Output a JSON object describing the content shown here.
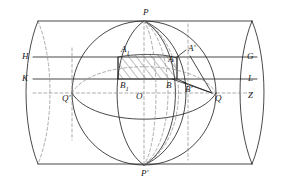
{
  "figure": {
    "stroke_color": "#1b1b1b",
    "dashed_color": "#7a7a7a",
    "hatch_color": "#4a4a4a",
    "background": "#ffffff"
  },
  "labels": [
    {
      "id": "P",
      "text": "P",
      "sub": "",
      "prime": "",
      "x": 143,
      "y": 8
    },
    {
      "id": "P-prime",
      "text": "P",
      "sub": "",
      "prime": "′",
      "x": 141,
      "y": 169
    },
    {
      "id": "H",
      "text": "H",
      "sub": "",
      "prime": "",
      "x": 22,
      "y": 52
    },
    {
      "id": "K",
      "text": "K",
      "sub": "",
      "prime": "",
      "x": 22,
      "y": 74
    },
    {
      "id": "G",
      "text": "G",
      "sub": "",
      "prime": "",
      "x": 247,
      "y": 52
    },
    {
      "id": "L",
      "text": "L",
      "sub": "",
      "prime": "",
      "x": 248,
      "y": 74
    },
    {
      "id": "Z",
      "text": "Z",
      "sub": "",
      "prime": "",
      "x": 248,
      "y": 91
    },
    {
      "id": "Q",
      "text": "Q",
      "sub": "",
      "prime": "",
      "x": 215,
      "y": 94
    },
    {
      "id": "Q-prime",
      "text": "Q",
      "sub": "",
      "prime": "′",
      "x": 62,
      "y": 94
    },
    {
      "id": "O",
      "text": "O",
      "sub": "",
      "prime": "",
      "x": 136,
      "y": 92
    },
    {
      "id": "A1",
      "text": "A",
      "sub": "1",
      "prime": "",
      "x": 121,
      "y": 45
    },
    {
      "id": "A",
      "text": "A",
      "sub": "",
      "prime": "",
      "x": 168,
      "y": 55
    },
    {
      "id": "A-prime",
      "text": "A",
      "sub": "",
      "prime": "′",
      "x": 188,
      "y": 44
    },
    {
      "id": "B1",
      "text": "B",
      "sub": "1",
      "prime": "",
      "x": 120,
      "y": 81
    },
    {
      "id": "B",
      "text": "B",
      "sub": "",
      "prime": "",
      "x": 166,
      "y": 81
    },
    {
      "id": "B-prime",
      "text": "B",
      "sub": "",
      "prime": "′",
      "x": 185,
      "y": 85
    }
  ]
}
